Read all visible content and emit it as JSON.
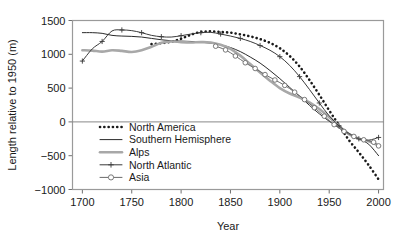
{
  "chart_data": {
    "type": "line",
    "title": "",
    "xlabel": "Year",
    "ylabel": "Length relative to 1950 (m)",
    "xlim": [
      1690,
      2005
    ],
    "ylim": [
      -1000,
      1500
    ],
    "xticks": [
      1700,
      1750,
      1800,
      1850,
      1900,
      1950,
      2000
    ],
    "xtick_labels": [
      "1700",
      "1750",
      "1800",
      "1850",
      "1900",
      "1950",
      "2000"
    ],
    "yticks": [
      -1000,
      -500,
      0,
      500,
      1000,
      1500
    ],
    "ytick_labels": [
      "-1000",
      "-500",
      "0",
      "500",
      "1000",
      "1500"
    ],
    "grid": false,
    "zero_line": true,
    "legend_position": "lower-left-inside",
    "series": [
      {
        "name": "North America",
        "style": "dotted",
        "color": "#1a1a1a",
        "width": 2.6,
        "marker": "none",
        "x": [
          1770,
          1780,
          1790,
          1800,
          1810,
          1820,
          1830,
          1840,
          1850,
          1860,
          1870,
          1880,
          1890,
          1900,
          1910,
          1920,
          1930,
          1940,
          1950,
          1960,
          1970,
          1980,
          1990,
          2000
        ],
        "y": [
          1150,
          1165,
          1185,
          1230,
          1290,
          1330,
          1340,
          1330,
          1320,
          1295,
          1265,
          1225,
          1170,
          1090,
          975,
          820,
          620,
          400,
          170,
          -50,
          -270,
          -450,
          -640,
          -850
        ]
      },
      {
        "name": "Southern Hemisphere",
        "style": "solid",
        "color": "#2a2a2a",
        "width": 1.0,
        "marker": "none",
        "x": [
          1700,
          1710,
          1720,
          1730,
          1740,
          1750,
          1760,
          1770,
          1780,
          1790,
          1800,
          1810,
          1820,
          1830,
          1840,
          1850,
          1860,
          1870,
          1880,
          1890,
          1900,
          1910,
          1920,
          1930,
          1940,
          1950,
          1960,
          1970,
          1980,
          1990,
          2000
        ],
        "y": [
          1320,
          1320,
          1310,
          1280,
          1270,
          1265,
          1255,
          1235,
          1215,
          1200,
          1195,
          1190,
          1180,
          1165,
          1140,
          1100,
          1040,
          960,
          870,
          760,
          640,
          510,
          380,
          245,
          120,
          10,
          -85,
          -170,
          -250,
          -330,
          -500
        ]
      },
      {
        "name": "Alps",
        "style": "solid",
        "color": "#a8a8a8",
        "width": 2.6,
        "marker": "none",
        "x": [
          1700,
          1710,
          1720,
          1730,
          1740,
          1750,
          1760,
          1770,
          1780,
          1790,
          1800,
          1810,
          1820,
          1830,
          1840,
          1850,
          1860,
          1870,
          1880,
          1890,
          1900,
          1910,
          1920,
          1930,
          1940,
          1950,
          1960,
          1970,
          1980,
          1990,
          2000
        ],
        "y": [
          1060,
          1055,
          1040,
          1060,
          1050,
          1035,
          1060,
          1110,
          1170,
          1190,
          1180,
          1175,
          1180,
          1175,
          1140,
          1080,
          980,
          855,
          730,
          610,
          500,
          420,
          360,
          290,
          190,
          70,
          -60,
          -180,
          -250,
          -285,
          -350
        ]
      },
      {
        "name": "North Atlantic",
        "style": "solid",
        "color": "#3a3a3a",
        "width": 1.0,
        "marker": "plus",
        "x": [
          1700,
          1710,
          1720,
          1730,
          1740,
          1750,
          1760,
          1770,
          1780,
          1790,
          1800,
          1810,
          1820,
          1830,
          1840,
          1850,
          1860,
          1870,
          1880,
          1890,
          1900,
          1910,
          1920,
          1930,
          1940,
          1950,
          1960,
          1970,
          1980,
          1990,
          2000
        ],
        "y": [
          900,
          1080,
          1190,
          1345,
          1360,
          1350,
          1320,
          1280,
          1260,
          1255,
          1275,
          1300,
          1320,
          1325,
          1300,
          1270,
          1235,
          1190,
          1130,
          1060,
          965,
          835,
          670,
          480,
          280,
          90,
          -60,
          -170,
          -250,
          -270,
          -230
        ]
      },
      {
        "name": "Asia",
        "style": "solid",
        "color": "#6b6b6b",
        "width": 1.0,
        "marker": "circle",
        "x": [
          1835,
          1845,
          1855,
          1865,
          1875,
          1885,
          1895,
          1905,
          1915,
          1925,
          1935,
          1945,
          1955,
          1965,
          1975,
          1985,
          1995,
          2000
        ],
        "y": [
          1120,
          1065,
          975,
          875,
          790,
          700,
          620,
          540,
          440,
          330,
          210,
          85,
          -40,
          -140,
          -215,
          -265,
          -300,
          -355
        ]
      }
    ]
  },
  "legend": {
    "items": [
      {
        "label": "North America",
        "swatch": "dotted-thick-black"
      },
      {
        "label": "Southern Hemisphere",
        "swatch": "solid-thin-black"
      },
      {
        "label": "Alps",
        "swatch": "solid-thick-gray"
      },
      {
        "label": "North Atlantic",
        "swatch": "line-plus-marker"
      },
      {
        "label": "Asia",
        "swatch": "line-circle-marker"
      }
    ]
  }
}
